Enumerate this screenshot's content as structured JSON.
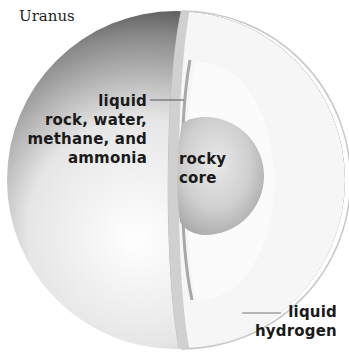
{
  "title": "Uranus",
  "labels": {
    "mantle": [
      "liquid",
      "rock, water,",
      "methane, and",
      "ammonia"
    ],
    "core": [
      "rocky",
      "core"
    ],
    "envelope": [
      "liquid",
      "hydrogen"
    ]
  },
  "colors": {
    "outer_dark": "#1a1a1a",
    "outer_light": "#f2f2f2",
    "envelope_cut": "#f7f7f7",
    "envelope_inner": "#fbfbfb",
    "mantle_band": "#c8c8c8",
    "core": "#bdbdbd",
    "text": "#1a1a1a"
  }
}
